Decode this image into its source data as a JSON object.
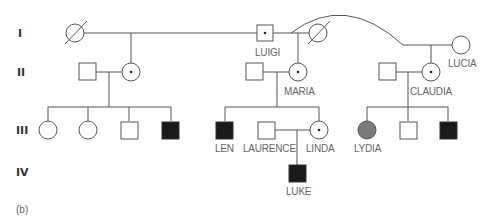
{
  "generations": [
    "I",
    "II",
    "III",
    "IV"
  ],
  "caption": "(b)",
  "individuals": {
    "luigi": {
      "name": "LUIGI",
      "sex": "male",
      "status": "carrier"
    },
    "lucia": {
      "name": "LUCIA",
      "sex": "female",
      "status": "unaffected"
    },
    "maria": {
      "name": "MARIA",
      "sex": "female",
      "status": "carrier"
    },
    "claudia": {
      "name": "CLAUDIA",
      "sex": "female",
      "status": "carrier"
    },
    "len": {
      "name": "LEN",
      "sex": "male",
      "status": "affected"
    },
    "laurence": {
      "name": "LAURENCE",
      "sex": "male",
      "status": "unaffected"
    },
    "linda": {
      "name": "LINDA",
      "sex": "female",
      "status": "carrier"
    },
    "lydia": {
      "name": "LYDIA",
      "sex": "female",
      "status": "partially-affected"
    },
    "luke": {
      "name": "LUKE",
      "sex": "male",
      "status": "affected"
    }
  },
  "colors": {
    "line": "#555555",
    "affected": "#1a1a1a",
    "partial": "#7a7a7a",
    "label": "#666666"
  }
}
